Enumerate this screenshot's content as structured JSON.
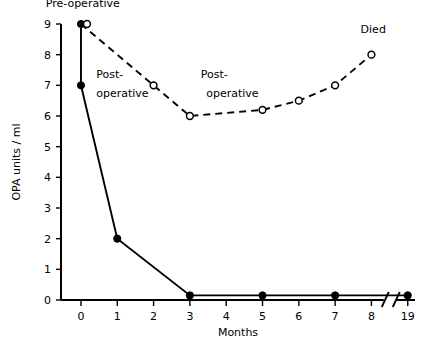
{
  "chart_data": {
    "type": "line",
    "title": "",
    "xlabel": "Months",
    "ylabel": "OPA units / ml",
    "xlim": [
      -0.55,
      9.2
    ],
    "ylim": [
      0,
      9
    ],
    "grid": false,
    "legend_position": "none",
    "x_tick_labels": [
      "0",
      "1",
      "2",
      "3",
      "4",
      "5",
      "6",
      "7",
      "8",
      "19"
    ],
    "x_tick_values": [
      0,
      1,
      2,
      3,
      4,
      5,
      6,
      7,
      8,
      9
    ],
    "y_tick_labels": [
      "0",
      "1",
      "2",
      "3",
      "4",
      "5",
      "6",
      "7",
      "8",
      "9"
    ],
    "y_tick_values": [
      0,
      1,
      2,
      3,
      4,
      5,
      6,
      7,
      8,
      9
    ],
    "axis_break": {
      "present": true,
      "between": [
        8,
        19
      ],
      "position": 8.45
    },
    "series": [
      {
        "name": "patient-solid",
        "style": "solid",
        "marker": "filled-circle",
        "x": [
          0,
          0,
          1,
          3,
          5,
          7,
          9
        ],
        "values": [
          9,
          7,
          2,
          0.15,
          0.15,
          0.15,
          0.15
        ]
      },
      {
        "name": "patient-dashed",
        "style": "dashed",
        "marker": "open-circle",
        "x": [
          0,
          2,
          3,
          5,
          6,
          7,
          8
        ],
        "values": [
          9,
          7,
          6,
          6.2,
          6.5,
          7,
          8
        ]
      }
    ],
    "annotations": [
      {
        "text": "Pre-operative",
        "x": 0,
        "y": 9,
        "label_x": 0.05,
        "label_y": 9.55,
        "anchor": "middle",
        "leader": false
      },
      {
        "text": "Post-",
        "x": 0,
        "y": 7,
        "label_x": 0.42,
        "label_y": 7.25,
        "anchor": "start",
        "leader": false
      },
      {
        "text": "operative",
        "x": 0,
        "y": 7,
        "label_x": 0.42,
        "label_y": 6.62,
        "anchor": "start",
        "leader": false
      },
      {
        "text": "Post-",
        "x": 3,
        "y": 6,
        "label_x": 3.3,
        "label_y": 7.25,
        "anchor": "start",
        "leader": false
      },
      {
        "text": "operative",
        "x": 3,
        "y": 6,
        "label_x": 3.45,
        "label_y": 6.62,
        "anchor": "start",
        "leader": false
      },
      {
        "text": "Died",
        "x": 8,
        "y": 8,
        "label_x": 8.05,
        "label_y": 8.72,
        "anchor": "middle",
        "leader": false
      }
    ]
  }
}
